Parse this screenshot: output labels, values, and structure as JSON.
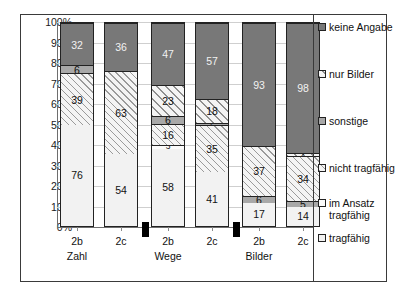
{
  "chart_data": {
    "type": "bar",
    "subtype": "100% stacked column",
    "title": "",
    "xlabel": "",
    "ylabel": "",
    "ylim": [
      0,
      100
    ],
    "ytick_labels": [
      "0%",
      "10%",
      "20%",
      "30%",
      "40%",
      "50%",
      "60%",
      "70%",
      "80%",
      "90%",
      "100%"
    ],
    "ytick_values": [
      0,
      10,
      20,
      30,
      40,
      50,
      60,
      70,
      80,
      90,
      100
    ],
    "grid": true,
    "legend_position": "right",
    "categories": [
      "2b",
      "2c",
      "2b",
      "2c",
      "2b",
      "2c"
    ],
    "groups": [
      {
        "label": "Zahl",
        "bars": [
          "2b",
          "2c"
        ]
      },
      {
        "label": "Wege",
        "bars": [
          "2b",
          "2c"
        ]
      },
      {
        "label": "Bilder",
        "bars": [
          "2b",
          "2c"
        ]
      }
    ],
    "series": [
      {
        "name": "tragfähig",
        "values": [
          76,
          54,
          58,
          41,
          17,
          14
        ]
      },
      {
        "name": "im Ansatz tragfähig",
        "values": [
          0,
          0,
          3,
          0,
          0,
          0
        ]
      },
      {
        "name": "nicht tragfähig",
        "values": [
          39,
          63,
          16,
          35,
          37,
          34
        ]
      },
      {
        "name": "sonstige",
        "values": [
          6,
          0,
          6,
          2,
          6,
          5
        ]
      },
      {
        "name": "nur Bilder",
        "values": [
          0,
          0,
          23,
          18,
          0,
          2
        ]
      },
      {
        "name": "keine Angabe",
        "values": [
          32,
          36,
          47,
          57,
          93,
          98
        ]
      }
    ],
    "bars": [
      {
        "group": "Zahl",
        "label": "2b",
        "total": 153,
        "segments": [
          {
            "name": "tragfähig",
            "value": 76,
            "fill": "f-tragfaehig",
            "show": true
          },
          {
            "name": "nicht tragfähig",
            "value": 39,
            "fill": "f-nicht",
            "show": true
          },
          {
            "name": "sonstige",
            "value": 6,
            "fill": "f-sonstige",
            "show": true
          },
          {
            "name": "keine Angabe",
            "value": 32,
            "fill": "f-keine",
            "show": true
          }
        ]
      },
      {
        "group": "Zahl",
        "label": "2c",
        "total": 153,
        "segments": [
          {
            "name": "tragfähig",
            "value": 54,
            "fill": "f-tragfaehig",
            "show": true
          },
          {
            "name": "nicht tragfähig",
            "value": 63,
            "fill": "f-nicht",
            "show": true
          },
          {
            "name": "keine Angabe",
            "value": 36,
            "fill": "f-keine",
            "show": true
          }
        ]
      },
      {
        "group": "Wege",
        "label": "2b",
        "total": 153,
        "segments": [
          {
            "name": "tragfähig",
            "value": 58,
            "fill": "f-tragfaehig",
            "show": true
          },
          {
            "name": "im Ansatz tragfähig",
            "value": 3,
            "fill": "f-ansatz",
            "show": true
          },
          {
            "name": "nicht tragfähig",
            "value": 16,
            "fill": "f-nicht",
            "show": true
          },
          {
            "name": "sonstige",
            "value": 6,
            "fill": "f-sonstige",
            "show": true
          },
          {
            "name": "nur Bilder",
            "value": 23,
            "fill": "f-nurbilder",
            "show": true
          },
          {
            "name": "keine Angabe",
            "value": 47,
            "fill": "f-keine",
            "show": true
          }
        ]
      },
      {
        "group": "Wege",
        "label": "2c",
        "total": 153,
        "segments": [
          {
            "name": "tragfähig",
            "value": 41,
            "fill": "f-tragfaehig",
            "show": true
          },
          {
            "name": "nicht tragfähig",
            "value": 35,
            "fill": "f-nicht",
            "show": true
          },
          {
            "name": "sonstige",
            "value": 2,
            "fill": "f-sonstige",
            "show": true
          },
          {
            "name": "nur Bilder",
            "value": 18,
            "fill": "f-nurbilder",
            "show": true
          },
          {
            "name": "keine Angabe",
            "value": 57,
            "fill": "f-keine",
            "show": true
          }
        ]
      },
      {
        "group": "Bilder",
        "label": "2b",
        "total": 153,
        "segments": [
          {
            "name": "tragfähig",
            "value": 17,
            "fill": "f-tragfaehig",
            "show": true
          },
          {
            "name": "sonstige",
            "value": 6,
            "fill": "f-sonstige",
            "show": true
          },
          {
            "name": "nicht tragfähig",
            "value": 37,
            "fill": "f-nicht",
            "show": true
          },
          {
            "name": "keine Angabe",
            "value": 93,
            "fill": "f-keine",
            "show": true
          }
        ]
      },
      {
        "group": "Bilder",
        "label": "2c",
        "total": 153,
        "segments": [
          {
            "name": "tragfähig",
            "value": 14,
            "fill": "f-tragfaehig",
            "show": true
          },
          {
            "name": "sonstige",
            "value": 5,
            "fill": "f-sonstige",
            "show": true
          },
          {
            "name": "nicht tragfähig",
            "value": 34,
            "fill": "f-nicht",
            "show": true
          },
          {
            "name": "nur Bilder",
            "value": 2,
            "fill": "f-nurbilder",
            "show": true
          },
          {
            "name": "keine Angabe",
            "value": 98,
            "fill": "f-keine",
            "show": true
          }
        ]
      }
    ],
    "legend": [
      {
        "label": "keine Angabe",
        "fill": "f-keine"
      },
      {
        "label": "nur Bilder",
        "fill": "f-nurbilder"
      },
      {
        "label": "sonstige",
        "fill": "f-sonstige"
      },
      {
        "label": "nicht tragfähig",
        "fill": "f-nicht"
      },
      {
        "label": "im Ansatz\ntragfähig",
        "fill": "f-ansatz"
      },
      {
        "label": "tragfähig",
        "fill": "f-tragfaehig"
      }
    ]
  }
}
